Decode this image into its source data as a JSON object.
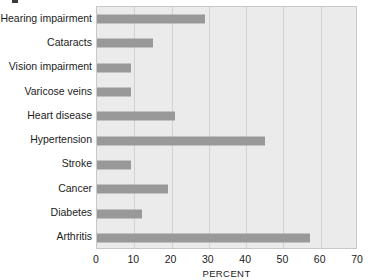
{
  "chart_data": {
    "type": "bar",
    "orientation": "horizontal",
    "title": "",
    "subtitle": "",
    "xlabel": "PERCENT",
    "ylabel": "",
    "xlim": [
      0,
      70
    ],
    "xticks": [
      0,
      10,
      20,
      30,
      40,
      50,
      60,
      70
    ],
    "xtick_labels": [
      "0",
      "10",
      "20",
      "30",
      "40",
      "50",
      "60",
      "70"
    ],
    "grid": true,
    "grid_axis": "x",
    "legend": false,
    "legend_position": "none",
    "categories": [
      "Hearing impairment",
      "Cataracts",
      "Vision impairment",
      "Varicose veins",
      "Heart disease",
      "Hypertension",
      "Stroke",
      "Cancer",
      "Diabetes",
      "Arthritis"
    ],
    "values": [
      29,
      15,
      9,
      9,
      21,
      45,
      9,
      19,
      12,
      57
    ],
    "colors": {
      "bar": "#999999",
      "plot_background": "#ebebeb",
      "gridline": "#d2d2d2",
      "plot_border": "#c8c8c8",
      "text": "#1c1c1c",
      "page_background": "#ffffff"
    }
  },
  "annotations": {
    "artifact_mark": ""
  }
}
